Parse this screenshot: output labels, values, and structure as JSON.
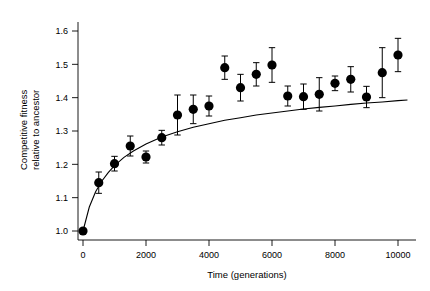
{
  "chart_data": {
    "type": "scatter",
    "title": "",
    "subtitle": "",
    "xlabel": "Time (generations)",
    "ylabel": "Competitive fitness relative to ancestor",
    "ylabel_line1": "Competitive fitness",
    "ylabel_line2": "relative to ancestor",
    "xlim": [
      0,
      10500
    ],
    "ylim": [
      0.96,
      1.64
    ],
    "xticks": [
      0,
      2000,
      4000,
      6000,
      8000,
      10000
    ],
    "xticklabels": [
      "0",
      "2000",
      "4000",
      "6000",
      "8000",
      "10000"
    ],
    "yticks": [
      1.0,
      1.1,
      1.2,
      1.3,
      1.4,
      1.5,
      1.6
    ],
    "yticklabels": [
      "1.0",
      "1.1",
      "1.2",
      "1.3",
      "1.4",
      "1.5",
      "1.6"
    ],
    "grid": false,
    "legend": false,
    "marker": "filled-circle",
    "marker_color": "#000000",
    "errorbar_color": "#000000",
    "curve_color": "#000000",
    "x": [
      0,
      500,
      1000,
      1500,
      2000,
      2500,
      3000,
      3500,
      4000,
      4500,
      5000,
      5500,
      6000,
      6500,
      7000,
      7500,
      8000,
      8500,
      9000,
      9500,
      10000
    ],
    "y": [
      1.0,
      1.145,
      1.202,
      1.255,
      1.222,
      1.28,
      1.348,
      1.365,
      1.375,
      1.49,
      1.43,
      1.47,
      1.498,
      1.405,
      1.403,
      1.41,
      1.443,
      1.455,
      1.402,
      1.475,
      1.528
    ],
    "yerr": [
      0.0,
      0.032,
      0.022,
      0.03,
      0.018,
      0.022,
      0.06,
      0.043,
      0.03,
      0.035,
      0.04,
      0.035,
      0.052,
      0.03,
      0.038,
      0.05,
      0.022,
      0.038,
      0.032,
      0.075,
      0.05
    ],
    "fit_curve": {
      "label": "hyperbolic fit",
      "x": [
        0,
        200,
        400,
        600,
        800,
        1000,
        1300,
        1600,
        2000,
        2500,
        3000,
        3500,
        4000,
        4500,
        5000,
        5500,
        6000,
        6500,
        7000,
        7500,
        8000,
        8500,
        9000,
        9500,
        10000,
        10300
      ],
      "y": [
        1.0,
        1.072,
        1.118,
        1.15,
        1.175,
        1.196,
        1.221,
        1.24,
        1.261,
        1.282,
        1.298,
        1.311,
        1.322,
        1.332,
        1.34,
        1.348,
        1.354,
        1.36,
        1.366,
        1.371,
        1.375,
        1.38,
        1.384,
        1.387,
        1.391,
        1.393
      ]
    }
  }
}
